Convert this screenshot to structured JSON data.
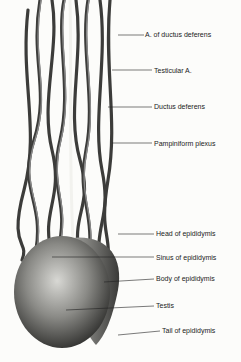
{
  "figure": {
    "labels": [
      {
        "id": "a-ductus",
        "text": "A. of ductus deferens",
        "x": 145,
        "y": 31,
        "lx1": 118,
        "ly1": 35,
        "lx2": 144,
        "ly2": 35
      },
      {
        "id": "testicular-a",
        "text": "Testicular A.",
        "x": 154,
        "y": 67,
        "lx1": 112,
        "ly1": 70,
        "lx2": 152,
        "ly2": 70
      },
      {
        "id": "ductus",
        "text": "Ductus deferens",
        "x": 154,
        "y": 103,
        "lx1": 108,
        "ly1": 107,
        "lx2": 152,
        "ly2": 107
      },
      {
        "id": "pampiniform",
        "text": "Pampiniform plexus",
        "x": 154,
        "y": 140,
        "lx1": 112,
        "ly1": 143,
        "lx2": 152,
        "ly2": 143
      },
      {
        "id": "head",
        "text": "Head of epididymis",
        "x": 156,
        "y": 230,
        "lx1": 118,
        "ly1": 234,
        "lx2": 154,
        "ly2": 234
      },
      {
        "id": "sinus",
        "text": "Sinus of epididymis",
        "x": 156,
        "y": 254,
        "lx1": 52,
        "ly1": 257,
        "lx2": 154,
        "ly2": 257
      },
      {
        "id": "body",
        "text": "Body of epididymis",
        "x": 156,
        "y": 275,
        "lx1": 104,
        "ly1": 282,
        "lx2": 154,
        "ly2": 279
      },
      {
        "id": "testis",
        "text": "Testis",
        "x": 156,
        "y": 302,
        "lx1": 66,
        "ly1": 310,
        "lx2": 154,
        "ly2": 306
      },
      {
        "id": "tail",
        "text": "Tail of epididymis",
        "x": 162,
        "y": 327,
        "lx1": 118,
        "ly1": 335,
        "lx2": 160,
        "ly2": 331
      }
    ]
  }
}
